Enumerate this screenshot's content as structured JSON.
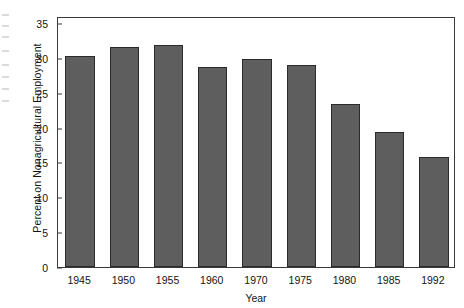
{
  "chart_data": {
    "type": "bar",
    "title": "",
    "xlabel": "Year",
    "ylabel": "Percent on Nonagricultural Employment",
    "categories": [
      "1945",
      "1950",
      "1955",
      "1960",
      "1970",
      "1975",
      "1980",
      "1985",
      "1992"
    ],
    "values": [
      30.3,
      31.6,
      31.9,
      28.7,
      29.8,
      29.0,
      23.4,
      19.3,
      15.8
    ],
    "ylim": [
      0,
      36
    ],
    "yticks": [
      0,
      5,
      10,
      15,
      20,
      25,
      30,
      35
    ],
    "ytick_labels": [
      "0",
      "5",
      "10",
      "15",
      "20",
      "25",
      "30",
      "35"
    ],
    "grid": false,
    "legend": null,
    "bar_color": "#5e5e5e",
    "bar_edge_color": "#2b2b2b",
    "axis_color": "#3a3a3a",
    "background": "#ffffff"
  },
  "axes": {
    "y_title": "Percent on Nonagricultural Employment",
    "x_title": "Year"
  }
}
